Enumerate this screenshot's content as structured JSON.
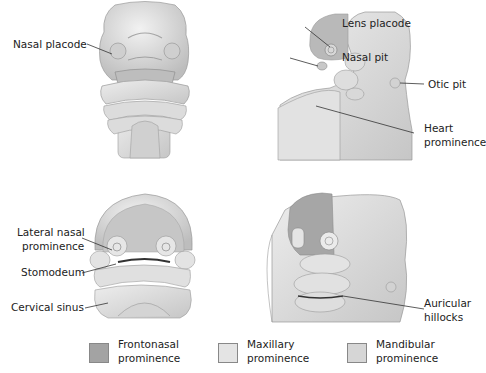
{
  "figure": {
    "panels": [
      {
        "id": "frontal-early",
        "labels": [
          {
            "text": "Nasal placode"
          }
        ]
      },
      {
        "id": "lateral-early",
        "labels": [
          {
            "text": "Lens placode"
          },
          {
            "text": "Nasal pit"
          },
          {
            "text": "Otic pit"
          },
          {
            "line1": "Heart",
            "line2": "prominence"
          }
        ]
      },
      {
        "id": "frontal-later",
        "labels": [
          {
            "line1": "Lateral nasal",
            "line2": "prominence"
          },
          {
            "text": "Stomodeum"
          },
          {
            "text": "Cervical sinus"
          }
        ]
      },
      {
        "id": "lateral-later",
        "labels": [
          {
            "line1": "Auricular",
            "line2": "hillocks"
          }
        ]
      }
    ]
  },
  "legend": {
    "items": [
      {
        "line1": "Frontonasal",
        "line2": "prominence",
        "color": "#a3a3a3"
      },
      {
        "line1": "Maxillary",
        "line2": "prominence",
        "color": "#e4e4e4"
      },
      {
        "line1": "Mandibular",
        "line2": "prominence",
        "color": "#d6d6d6"
      }
    ]
  },
  "colors": {
    "tissue_light": "#e6e6e6",
    "tissue_mid": "#cfcfcf",
    "tissue_dark": "#a8a8a8",
    "frontonasal": "#a3a3a3",
    "outline": "#9a9a9a"
  }
}
